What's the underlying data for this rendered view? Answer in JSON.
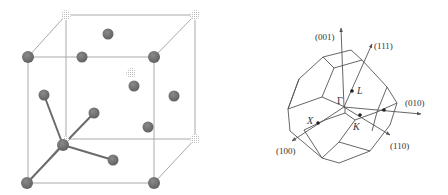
{
  "figure_left": {
    "title": "Zincblende / diamond crystal unit cell",
    "colors": {
      "edge": "#a8a8a8",
      "bond": "#6a6a6a",
      "atom": "#6f6f6f",
      "atom_dark": "#5a5a5a",
      "atom_stipple": "#c8c8c8"
    }
  },
  "figure_right": {
    "title": "First Brillouin zone of FCC lattice",
    "labels": {
      "axis_001": "(001)",
      "axis_111": "(111)",
      "axis_010": "(010)",
      "axis_110": "(110)",
      "axis_100": "(100)",
      "point_gamma": "Γ",
      "point_L": "L",
      "point_X": "X",
      "point_K": "K"
    },
    "colors": {
      "line": "#555555",
      "text": "#333333"
    }
  }
}
